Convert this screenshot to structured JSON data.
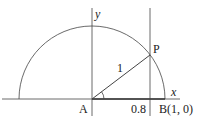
{
  "diagram": {
    "labels": {
      "y_axis": "y",
      "x_axis": "x",
      "point_p": "P",
      "point_a": "A",
      "point_b": "B(1, 0)",
      "radius": "1",
      "tick_08": "0.8"
    },
    "colors": {
      "stroke": "#444444",
      "text": "#222222"
    }
  }
}
